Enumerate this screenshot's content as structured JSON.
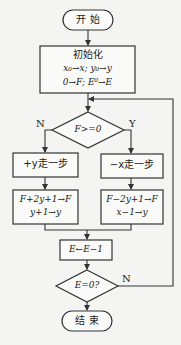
{
  "flowchart": {
    "start": {
      "label": "开  始"
    },
    "init": {
      "title": "初始化",
      "line1": "x₀→x; y₀→y",
      "line2": "0→F; E⁰→E"
    },
    "decision1": {
      "label": "F>=0",
      "no_label": "N",
      "yes_label": "Y"
    },
    "left_step": {
      "label": "+y走一步"
    },
    "left_update": {
      "line1": "F+2y+1→F",
      "line2": "y+1→y"
    },
    "right_step": {
      "label": "−x走一步"
    },
    "right_update": {
      "line1": "F−2y+1→F",
      "line2": "x−1→y"
    },
    "decrement": {
      "label": "E←E−1"
    },
    "decision2": {
      "label": "E=0?",
      "no_label": "N"
    },
    "end": {
      "label": "结  束"
    }
  },
  "colors": {
    "line": "#333333",
    "background": "#f4f4f2",
    "fill": "#fafaf8"
  }
}
